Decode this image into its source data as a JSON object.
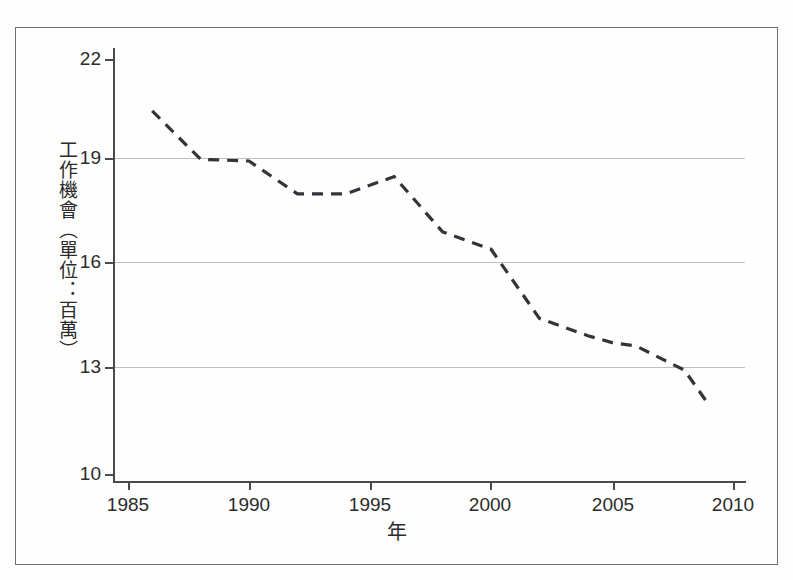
{
  "chart_data": {
    "type": "line",
    "title": "",
    "subtitle": "",
    "xlabel": "年",
    "ylabel": "工作機會（單位：百萬）",
    "xlim": [
      1985,
      2010
    ],
    "ylim": [
      10,
      22
    ],
    "xticks": [
      1985,
      1990,
      1995,
      2000,
      2005,
      2010
    ],
    "yticks": [
      10,
      13,
      16,
      19,
      22
    ],
    "xtick_labels": [
      "1985",
      "1990",
      "1995",
      "2000",
      "2005",
      "2010"
    ],
    "ytick_labels": [
      "10",
      "13",
      "16",
      "19",
      "22"
    ],
    "grid": "horizontal",
    "gridlines_y": [
      13,
      16,
      19
    ],
    "legend": null,
    "legend_position": "none",
    "line_style": "dashed",
    "line_color": "#33333a",
    "series": [
      {
        "name": "工作機會",
        "x": [
          1986,
          1988,
          1990,
          1992,
          1994,
          1996,
          1998,
          2000,
          2002,
          2004,
          2005,
          2006,
          2008,
          2009
        ],
        "values": [
          20.5,
          19.1,
          19.05,
          18.1,
          18.1,
          18.6,
          17.0,
          16.5,
          14.5,
          14.0,
          13.8,
          13.7,
          13.0,
          12.0
        ]
      }
    ],
    "annotations": []
  },
  "axes": {
    "y_title_chars": "工作機會（單位：百萬）",
    "x_title": "年"
  }
}
